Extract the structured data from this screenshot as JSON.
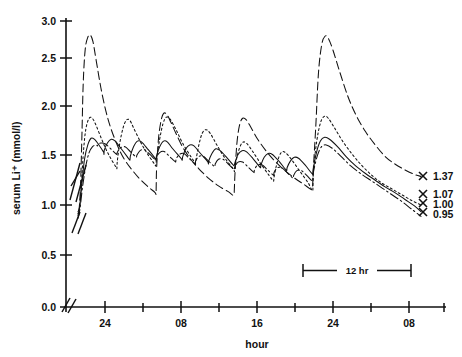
{
  "chart_data": {
    "type": "line",
    "title": "",
    "xlabel": "hour",
    "ylabel": "serum Li+  (mmol/l)",
    "ylabel_display": "serum Li⁺  (mmol/l)",
    "ylim": [
      0.0,
      3.0
    ],
    "ytick_values": [
      0.0,
      0.5,
      1.0,
      1.5,
      2.0,
      2.5,
      3.0
    ],
    "ytick_labels": [
      "0.0",
      "0.5",
      "1.0",
      "1.5",
      "2.0",
      "2.5",
      "3.0"
    ],
    "xtick_labels": [
      "24",
      "08",
      "16",
      "24",
      "08"
    ],
    "xtick_minor_count": 5,
    "x_axis_break": true,
    "y_axis_break": true,
    "y_axis_break_range": [
      1.05,
      1.45
    ],
    "grid": false,
    "legend_position": "right-endpoints",
    "annotations": [
      {
        "name": "scale-bar",
        "label": "12 hr",
        "hours": 12
      }
    ],
    "endpoint_markers": [
      {
        "label": "1.37",
        "value": 1.37,
        "marker": "x",
        "series": "once-daily-1200mg"
      },
      {
        "label": "1.07",
        "value": 1.07,
        "marker": "x",
        "series": "twice-daily-600mg"
      },
      {
        "label": "1.00",
        "value": 1.0,
        "marker": "x",
        "series": "three-times-daily-400mg"
      },
      {
        "label": "0.95",
        "value": 0.95,
        "marker": "x",
        "series": "four-times-daily-300mg"
      }
    ],
    "series": [
      {
        "name": "once-daily-1200mg",
        "style": "long-dash",
        "peak_max": 2.85,
        "trough_min": 1.05,
        "endpoint": 1.37,
        "doses_per_day": 1,
        "points": [
          [
            0.0,
            1.0
          ],
          [
            0.4,
            1.05
          ],
          [
            0.8,
            1.3
          ],
          [
            1.2,
            1.8
          ],
          [
            1.6,
            2.35
          ],
          [
            2.2,
            2.7
          ],
          [
            3.0,
            2.83
          ],
          [
            3.8,
            2.85
          ],
          [
            4.6,
            2.78
          ],
          [
            5.6,
            2.58
          ],
          [
            7.0,
            2.3
          ],
          [
            8.5,
            2.06
          ],
          [
            10.0,
            1.88
          ],
          [
            12.0,
            1.7
          ],
          [
            14.0,
            1.56
          ],
          [
            16.5,
            1.44
          ],
          [
            19.0,
            1.34
          ],
          [
            21.5,
            1.26
          ],
          [
            23.6,
            1.2
          ],
          [
            23.9,
            1.18
          ],
          [
            24.0,
            1.4
          ],
          [
            24.6,
            1.75
          ],
          [
            25.4,
            1.95
          ],
          [
            26.2,
            2.03
          ],
          [
            27.2,
            2.02
          ],
          [
            28.4,
            1.94
          ],
          [
            30.0,
            1.82
          ],
          [
            32.0,
            1.68
          ],
          [
            34.5,
            1.55
          ],
          [
            37.0,
            1.45
          ],
          [
            40.0,
            1.35
          ],
          [
            43.0,
            1.27
          ],
          [
            46.0,
            1.21
          ],
          [
            47.8,
            1.18
          ],
          [
            48.0,
            1.36
          ],
          [
            48.6,
            1.7
          ],
          [
            49.4,
            1.9
          ],
          [
            50.4,
            1.98
          ],
          [
            51.6,
            1.96
          ],
          [
            53.0,
            1.88
          ],
          [
            55.0,
            1.76
          ],
          [
            57.5,
            1.64
          ],
          [
            60.0,
            1.54
          ],
          [
            63.0,
            1.44
          ],
          [
            66.0,
            1.36
          ],
          [
            69.0,
            1.29
          ],
          [
            71.8,
            1.24
          ],
          [
            72.0,
            1.42
          ],
          [
            72.8,
            1.9
          ],
          [
            73.6,
            2.45
          ],
          [
            74.6,
            2.75
          ],
          [
            75.6,
            2.84
          ],
          [
            76.6,
            2.82
          ],
          [
            78.0,
            2.7
          ],
          [
            80.0,
            2.48
          ],
          [
            82.5,
            2.22
          ],
          [
            85.0,
            2.02
          ],
          [
            88.0,
            1.84
          ],
          [
            91.0,
            1.7
          ],
          [
            94.0,
            1.58
          ],
          [
            97.0,
            1.5
          ],
          [
            100.0,
            1.44
          ],
          [
            103.0,
            1.39
          ],
          [
            105.0,
            1.37
          ]
        ]
      },
      {
        "name": "twice-daily-600mg",
        "style": "short-dash",
        "peak_max": 2.0,
        "trough_min": 1.1,
        "endpoint": 1.07,
        "doses_per_day": 2,
        "points": [
          [
            0.0,
            0.98
          ],
          [
            0.4,
            1.02
          ],
          [
            0.9,
            1.2
          ],
          [
            1.5,
            1.55
          ],
          [
            2.2,
            1.82
          ],
          [
            3.0,
            1.95
          ],
          [
            3.8,
            1.99
          ],
          [
            4.6,
            1.97
          ],
          [
            5.6,
            1.9
          ],
          [
            7.0,
            1.78
          ],
          [
            8.5,
            1.66
          ],
          [
            10.0,
            1.56
          ],
          [
            11.6,
            1.47
          ],
          [
            11.9,
            1.45
          ],
          [
            12.0,
            1.52
          ],
          [
            12.8,
            1.72
          ],
          [
            13.8,
            1.88
          ],
          [
            14.8,
            1.96
          ],
          [
            15.8,
            1.96
          ],
          [
            17.0,
            1.88
          ],
          [
            19.0,
            1.74
          ],
          [
            21.0,
            1.62
          ],
          [
            23.0,
            1.52
          ],
          [
            23.8,
            1.48
          ],
          [
            24.0,
            1.54
          ],
          [
            25.0,
            1.76
          ],
          [
            26.0,
            1.92
          ],
          [
            27.0,
            1.99
          ],
          [
            28.2,
            1.97
          ],
          [
            30.0,
            1.86
          ],
          [
            32.0,
            1.72
          ],
          [
            34.5,
            1.58
          ],
          [
            36.0,
            1.5
          ],
          [
            35.9,
            1.48
          ],
          [
            36.0,
            1.52
          ],
          [
            37.0,
            1.7
          ],
          [
            38.0,
            1.82
          ],
          [
            39.2,
            1.86
          ],
          [
            40.5,
            1.82
          ],
          [
            42.5,
            1.7
          ],
          [
            45.0,
            1.56
          ],
          [
            47.5,
            1.45
          ],
          [
            47.9,
            1.42
          ],
          [
            48.0,
            1.46
          ],
          [
            49.0,
            1.62
          ],
          [
            50.2,
            1.72
          ],
          [
            51.5,
            1.72
          ],
          [
            53.5,
            1.63
          ],
          [
            56.0,
            1.5
          ],
          [
            58.5,
            1.38
          ],
          [
            59.9,
            1.32
          ],
          [
            60.0,
            1.36
          ],
          [
            61.0,
            1.52
          ],
          [
            62.2,
            1.62
          ],
          [
            63.5,
            1.62
          ],
          [
            65.5,
            1.54
          ],
          [
            68.0,
            1.42
          ],
          [
            70.5,
            1.3
          ],
          [
            71.9,
            1.22
          ],
          [
            72.0,
            1.4
          ],
          [
            73.0,
            1.72
          ],
          [
            74.2,
            1.93
          ],
          [
            75.4,
            2.0
          ],
          [
            76.6,
            1.98
          ],
          [
            78.5,
            1.88
          ],
          [
            81.0,
            1.74
          ],
          [
            84.0,
            1.6
          ],
          [
            87.0,
            1.48
          ],
          [
            90.0,
            1.38
          ],
          [
            93.0,
            1.3
          ],
          [
            96.0,
            1.24
          ],
          [
            99.0,
            1.18
          ],
          [
            102.0,
            1.12
          ],
          [
            105.0,
            1.07
          ]
        ]
      },
      {
        "name": "three-times-daily-400mg",
        "style": "solid",
        "peak_max": 1.78,
        "trough_min": 1.15,
        "endpoint": 1.0,
        "doses_per_day": 3,
        "points": [
          [
            0.0,
            0.96
          ],
          [
            0.5,
            1.05
          ],
          [
            1.2,
            1.3
          ],
          [
            2.0,
            1.55
          ],
          [
            3.0,
            1.7
          ],
          [
            4.0,
            1.77
          ],
          [
            5.0,
            1.76
          ],
          [
            6.4,
            1.7
          ],
          [
            7.9,
            1.62
          ],
          [
            7.95,
            1.6
          ],
          [
            8.0,
            1.64
          ],
          [
            9.0,
            1.72
          ],
          [
            10.2,
            1.76
          ],
          [
            11.4,
            1.74
          ],
          [
            13.0,
            1.67
          ],
          [
            15.0,
            1.58
          ],
          [
            15.9,
            1.54
          ],
          [
            16.0,
            1.58
          ],
          [
            17.0,
            1.68
          ],
          [
            18.2,
            1.74
          ],
          [
            19.5,
            1.73
          ],
          [
            21.5,
            1.65
          ],
          [
            23.6,
            1.56
          ],
          [
            23.9,
            1.54
          ],
          [
            24.0,
            1.58
          ],
          [
            25.0,
            1.68
          ],
          [
            26.2,
            1.74
          ],
          [
            27.4,
            1.73
          ],
          [
            29.0,
            1.66
          ],
          [
            31.5,
            1.56
          ],
          [
            31.9,
            1.54
          ],
          [
            32.0,
            1.57
          ],
          [
            33.0,
            1.66
          ],
          [
            34.2,
            1.7
          ],
          [
            35.5,
            1.69
          ],
          [
            37.5,
            1.61
          ],
          [
            39.8,
            1.52
          ],
          [
            39.95,
            1.5
          ],
          [
            40.0,
            1.53
          ],
          [
            41.0,
            1.61
          ],
          [
            42.2,
            1.66
          ],
          [
            43.5,
            1.64
          ],
          [
            45.5,
            1.57
          ],
          [
            47.8,
            1.48
          ],
          [
            48.0,
            1.51
          ],
          [
            49.0,
            1.6
          ],
          [
            50.2,
            1.64
          ],
          [
            51.5,
            1.63
          ],
          [
            53.5,
            1.56
          ],
          [
            55.9,
            1.46
          ],
          [
            56.0,
            1.49
          ],
          [
            57.0,
            1.57
          ],
          [
            58.2,
            1.61
          ],
          [
            59.5,
            1.6
          ],
          [
            61.5,
            1.53
          ],
          [
            63.9,
            1.43
          ],
          [
            64.0,
            1.46
          ],
          [
            65.0,
            1.53
          ],
          [
            66.2,
            1.57
          ],
          [
            67.5,
            1.56
          ],
          [
            69.5,
            1.49
          ],
          [
            71.9,
            1.39
          ],
          [
            72.0,
            1.44
          ],
          [
            73.0,
            1.62
          ],
          [
            74.2,
            1.74
          ],
          [
            75.5,
            1.78
          ],
          [
            77.0,
            1.76
          ],
          [
            79.5,
            1.68
          ],
          [
            82.0,
            1.58
          ],
          [
            85.0,
            1.48
          ],
          [
            88.0,
            1.4
          ],
          [
            91.0,
            1.33
          ],
          [
            94.0,
            1.26
          ],
          [
            97.0,
            1.2
          ],
          [
            100.0,
            1.13
          ],
          [
            103.0,
            1.06
          ],
          [
            105.0,
            1.0
          ]
        ]
      },
      {
        "name": "four-times-daily-300mg",
        "style": "dash-dot",
        "peak_max": 1.72,
        "trough_min": 1.18,
        "endpoint": 0.95,
        "doses_per_day": 4,
        "points": [
          [
            0.0,
            0.93
          ],
          [
            0.6,
            1.03
          ],
          [
            1.4,
            1.26
          ],
          [
            2.4,
            1.48
          ],
          [
            3.4,
            1.62
          ],
          [
            4.4,
            1.68
          ],
          [
            5.5,
            1.7
          ],
          [
            5.95,
            1.69
          ],
          [
            6.0,
            1.7
          ],
          [
            7.0,
            1.72
          ],
          [
            8.4,
            1.71
          ],
          [
            10.0,
            1.66
          ],
          [
            11.9,
            1.6
          ],
          [
            12.0,
            1.62
          ],
          [
            13.0,
            1.67
          ],
          [
            14.4,
            1.68
          ],
          [
            16.0,
            1.63
          ],
          [
            17.9,
            1.57
          ],
          [
            18.0,
            1.59
          ],
          [
            19.0,
            1.64
          ],
          [
            20.4,
            1.65
          ],
          [
            22.0,
            1.6
          ],
          [
            23.9,
            1.54
          ],
          [
            24.0,
            1.57
          ],
          [
            25.0,
            1.62
          ],
          [
            26.4,
            1.63
          ],
          [
            28.0,
            1.58
          ],
          [
            29.9,
            1.52
          ],
          [
            30.0,
            1.55
          ],
          [
            31.0,
            1.6
          ],
          [
            32.4,
            1.61
          ],
          [
            34.0,
            1.56
          ],
          [
            35.9,
            1.5
          ],
          [
            36.0,
            1.53
          ],
          [
            37.0,
            1.58
          ],
          [
            38.4,
            1.58
          ],
          [
            40.0,
            1.53
          ],
          [
            41.9,
            1.47
          ],
          [
            42.0,
            1.5
          ],
          [
            43.0,
            1.55
          ],
          [
            44.4,
            1.55
          ],
          [
            46.0,
            1.5
          ],
          [
            47.9,
            1.44
          ],
          [
            48.0,
            1.47
          ],
          [
            49.0,
            1.52
          ],
          [
            50.4,
            1.52
          ],
          [
            52.0,
            1.47
          ],
          [
            53.9,
            1.41
          ],
          [
            54.0,
            1.44
          ],
          [
            55.0,
            1.49
          ],
          [
            56.4,
            1.49
          ],
          [
            58.0,
            1.44
          ],
          [
            59.9,
            1.38
          ],
          [
            60.0,
            1.41
          ],
          [
            61.0,
            1.46
          ],
          [
            62.4,
            1.46
          ],
          [
            64.0,
            1.41
          ],
          [
            65.9,
            1.35
          ],
          [
            66.0,
            1.38
          ],
          [
            67.0,
            1.43
          ],
          [
            68.4,
            1.43
          ],
          [
            70.0,
            1.38
          ],
          [
            71.9,
            1.32
          ],
          [
            72.0,
            1.4
          ],
          [
            73.2,
            1.58
          ],
          [
            74.5,
            1.68
          ],
          [
            76.0,
            1.7
          ],
          [
            78.0,
            1.66
          ],
          [
            80.5,
            1.58
          ],
          [
            83.5,
            1.48
          ],
          [
            86.5,
            1.4
          ],
          [
            90.0,
            1.32
          ],
          [
            93.0,
            1.25
          ],
          [
            96.0,
            1.18
          ],
          [
            99.0,
            1.11
          ],
          [
            102.0,
            1.03
          ],
          [
            105.0,
            0.95
          ]
        ]
      }
    ]
  }
}
